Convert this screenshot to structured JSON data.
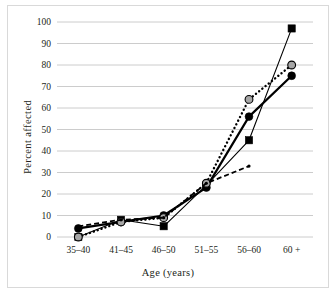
{
  "figure": {
    "border_color": "#d9d9d9",
    "background": "#ffffff"
  },
  "chart_data": {
    "type": "line",
    "title": "",
    "xlabel": "Age (years)",
    "ylabel": "Percent  affected",
    "categories": [
      "35–40",
      "41–45",
      "46–50",
      "51–55",
      "56–60",
      "60 +"
    ],
    "ylim": [
      0,
      100
    ],
    "ytick_step": 10,
    "yticks": [
      "0",
      "10",
      "20",
      "30",
      "40",
      "50",
      "60",
      "70",
      "80",
      "90",
      "100"
    ],
    "grid": "horizontal",
    "grid_color": "#bfbfbf",
    "legend": "none",
    "series": [
      {
        "name": "series-squares",
        "line_style": "solid-thin",
        "marker": "square-filled",
        "color": "#000000",
        "values": [
          0,
          8,
          5,
          24,
          45,
          97
        ]
      },
      {
        "name": "series-circles",
        "line_style": "solid-thick",
        "marker": "circle-filled",
        "color": "#000000",
        "values": [
          4,
          7,
          10,
          23,
          56,
          75
        ]
      },
      {
        "name": "series-open-circles",
        "line_style": "dotted",
        "marker": "circle-open-gray",
        "color": "#000000",
        "marker_fill": "#a6a6a6",
        "values": [
          0,
          7,
          9,
          25,
          64,
          80
        ]
      },
      {
        "name": "series-dashed",
        "line_style": "dashed",
        "marker": "circle-small",
        "color": "#000000",
        "values": [
          5,
          8,
          9,
          25,
          33,
          null
        ]
      }
    ]
  }
}
